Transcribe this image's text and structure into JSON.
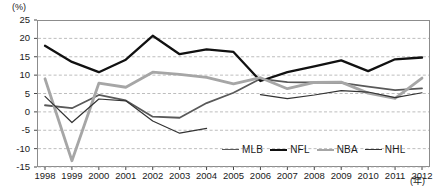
{
  "chart_data": {
    "type": "line",
    "title": "",
    "xlabel": "(年)",
    "ylabel": "(%)",
    "y_unit": "(%)",
    "x_unit": "(年)",
    "grid": true,
    "grid_style": "dashed-horizontal",
    "legend_position": "bottom-right",
    "ylim": [
      -15,
      25
    ],
    "ytick_labels": [
      "25",
      "20",
      "15",
      "10",
      "5",
      "0",
      "-5",
      "-10",
      "-15"
    ],
    "yticks": [
      25,
      20,
      15,
      10,
      5,
      0,
      -5,
      -10,
      -15
    ],
    "categories": [
      "1998",
      "1999",
      "2000",
      "2001",
      "2002",
      "2003",
      "2004",
      "2005",
      "2006",
      "2007",
      "2008",
      "2009",
      "2010",
      "2011",
      "2012"
    ],
    "x": [
      1998,
      1999,
      2000,
      2001,
      2002,
      2003,
      2004,
      2005,
      2006,
      2007,
      2008,
      2009,
      2010,
      2011,
      2012
    ],
    "series": [
      {
        "name": "MLB",
        "color": "#595959",
        "width": 1.8,
        "values": [
          1.8,
          1.0,
          4.6,
          3.1,
          -1.3,
          -1.6,
          2.4,
          5.2,
          9.0,
          8.1,
          8.0,
          7.9,
          6.9,
          5.9,
          6.4
        ]
      },
      {
        "name": "NFL",
        "color": "#111111",
        "width": 2.3,
        "values": [
          18.0,
          13.6,
          10.8,
          14.2,
          20.7,
          15.7,
          17.0,
          16.3,
          8.4,
          10.8,
          12.4,
          14.0,
          11.1,
          14.3,
          14.8
        ]
      },
      {
        "name": "NBA",
        "color": "#a6a6a6",
        "width": 2.8,
        "values": [
          9.0,
          -13.3,
          7.8,
          6.7,
          10.8,
          10.2,
          9.4,
          7.6,
          9.3,
          6.3,
          8.0,
          8.1,
          5.1,
          3.7,
          9.2
        ]
      },
      {
        "name": "NHL",
        "color": "#333333",
        "width": 1.2,
        "values": [
          4.2,
          -2.9,
          3.5,
          3.0,
          -2.5,
          -5.8,
          -4.5,
          null,
          4.7,
          3.6,
          4.6,
          5.8,
          5.4,
          3.9,
          5.2
        ]
      }
    ]
  },
  "legend": {
    "entries": [
      {
        "label": "MLB"
      },
      {
        "label": "NFL"
      },
      {
        "label": "NBA"
      },
      {
        "label": "NHL"
      }
    ]
  }
}
